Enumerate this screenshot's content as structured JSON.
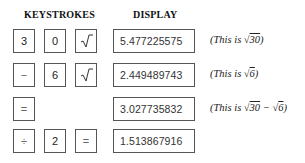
{
  "headers": {
    "keystrokes": "KEYSTROKES",
    "display": "DISPLAY"
  },
  "rows": [
    {
      "keys": [
        "3",
        "0",
        "sqrt"
      ],
      "display": "5.477225575",
      "note": {
        "prefix": "(This is ",
        "expr": [
          "√",
          "30"
        ],
        "suffix": ")"
      }
    },
    {
      "keys": [
        "−",
        "6",
        "sqrt"
      ],
      "display": "2.449489743",
      "note": {
        "prefix": "(This is ",
        "expr": [
          "√",
          "6"
        ],
        "suffix": ")"
      }
    },
    {
      "keys": [
        "="
      ],
      "display": "3.027735832",
      "note": {
        "prefix": "(This is ",
        "expr1": [
          "√",
          "30"
        ],
        "minus": " − ",
        "expr2": [
          "√",
          "6"
        ],
        "suffix": ")"
      }
    },
    {
      "keys": [
        "÷",
        "2",
        "="
      ],
      "display": "1.513867916"
    }
  ],
  "icons": {
    "sqrt": "square-root-icon"
  }
}
